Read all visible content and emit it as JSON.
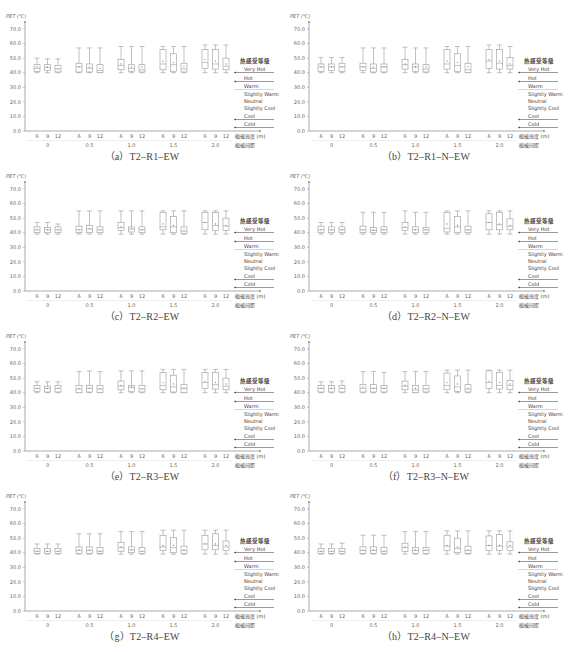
{
  "chart_data": {
    "type": "box",
    "figure_caption": "",
    "shared": {
      "ylabel": "PET (℃)",
      "yticks": [
        "0.0",
        "10.0",
        "20.0",
        "30.0",
        "40.0",
        "50.0",
        "60.0",
        "70.0"
      ],
      "ylim": [
        0,
        75
      ],
      "x_inner_label": "植被高度 (m)",
      "x_outer_label": "植被间距",
      "x_inner_ticks": [
        "6",
        "9",
        "12"
      ],
      "x_outer_groups": [
        "0",
        "0.5",
        "1.0",
        "1.5",
        "2.0"
      ],
      "legend_title": "热感受等级",
      "legend_levels": [
        "Very Hot",
        "Hot",
        "Warm",
        "Slightly Warm",
        "Neutral",
        "Slightly Cool",
        "Cool",
        "Cold"
      ],
      "legend_thresholds": [
        41,
        35,
        29,
        23,
        18,
        13,
        8,
        4
      ]
    },
    "panels": [
      {
        "caption": "（a）T2–R1–EW",
        "boxes": [
          [
            40,
            41,
            43,
            45.5,
            50,
            44
          ],
          [
            40,
            41.5,
            43.5,
            45.5,
            49.5,
            44
          ],
          [
            40,
            40.5,
            42.5,
            45,
            49.5,
            43
          ],
          [
            40,
            40.5,
            44,
            46.5,
            57,
            44
          ],
          [
            40,
            40.5,
            43,
            46,
            57,
            44
          ],
          [
            40,
            40,
            41.5,
            45.5,
            57,
            43
          ],
          [
            40,
            42,
            45,
            49,
            58,
            46
          ],
          [
            40,
            41,
            43,
            45.5,
            58,
            44
          ],
          [
            40,
            40.5,
            42,
            45.5,
            58,
            44
          ],
          [
            40,
            42,
            46,
            56,
            58,
            48
          ],
          [
            40,
            41,
            45.5,
            53,
            58,
            47
          ],
          [
            40,
            40.5,
            42.5,
            46.5,
            58,
            44
          ],
          [
            40,
            43,
            47,
            56,
            59,
            49
          ],
          [
            40,
            42.5,
            46,
            56,
            59,
            48
          ],
          [
            40,
            42,
            44.5,
            50,
            59,
            46
          ]
        ]
      },
      {
        "caption": "（b）T2–R1–N–EW",
        "boxes": [
          [
            40,
            41,
            44,
            46,
            50.5,
            44
          ],
          [
            40,
            41.5,
            44,
            46,
            50.5,
            44
          ],
          [
            40,
            41,
            44,
            46.5,
            50.5,
            44
          ],
          [
            40,
            41.5,
            44,
            46.5,
            57,
            44
          ],
          [
            40,
            40.5,
            43,
            46,
            57,
            44
          ],
          [
            40,
            40.5,
            44,
            46,
            57,
            44
          ],
          [
            40,
            42.5,
            45.5,
            49,
            57.5,
            46
          ],
          [
            40,
            41,
            44,
            46,
            57,
            44
          ],
          [
            40,
            40.5,
            42.5,
            45.5,
            57,
            44
          ],
          [
            40,
            42.5,
            46,
            56,
            58,
            48
          ],
          [
            40,
            41,
            45,
            53,
            58,
            47
          ],
          [
            40,
            40,
            42,
            46.5,
            58,
            44
          ],
          [
            40,
            43,
            48,
            56,
            59,
            49
          ],
          [
            40,
            42.5,
            46.5,
            56,
            59,
            48
          ],
          [
            40,
            42.5,
            45,
            50.5,
            58,
            46
          ]
        ]
      },
      {
        "caption": "（c）T2–R2–EW",
        "boxes": [
          [
            39,
            40,
            42,
            44,
            47,
            42
          ],
          [
            39,
            40,
            42,
            43.5,
            47,
            42
          ],
          [
            39,
            40,
            42,
            44,
            46,
            42
          ],
          [
            39,
            40,
            42,
            44.5,
            55,
            42
          ],
          [
            39,
            40,
            42.5,
            45,
            55,
            43
          ],
          [
            39,
            40,
            42,
            44,
            55,
            42
          ],
          [
            39,
            41.5,
            43.5,
            47,
            55,
            44
          ],
          [
            39,
            40.5,
            42.5,
            44,
            55,
            43
          ],
          [
            39,
            40,
            42,
            44,
            55,
            42
          ],
          [
            39,
            42,
            44,
            54,
            55,
            46
          ],
          [
            39,
            40,
            44,
            51,
            55,
            45
          ],
          [
            39,
            39.5,
            41,
            44,
            55,
            42
          ],
          [
            39,
            42,
            47,
            54,
            55,
            47
          ],
          [
            39,
            41.5,
            45,
            54,
            55,
            46
          ],
          [
            39,
            41.5,
            44.5,
            50,
            55,
            45
          ]
        ]
      },
      {
        "caption": "（d）T2–R2–N–EW",
        "boxes": [
          [
            39,
            40,
            42,
            44.5,
            47,
            42
          ],
          [
            39,
            40,
            42,
            44,
            47,
            42
          ],
          [
            39,
            40,
            42,
            44,
            47,
            42
          ],
          [
            39,
            40,
            42,
            44.5,
            54,
            42
          ],
          [
            39,
            40,
            41.5,
            43.5,
            54,
            42
          ],
          [
            39,
            40,
            42,
            44,
            54,
            42
          ],
          [
            39,
            41.5,
            43.5,
            47,
            55,
            44
          ],
          [
            39,
            40,
            42,
            44,
            54,
            42
          ],
          [
            39,
            40,
            42,
            43.5,
            54,
            42
          ],
          [
            39,
            40.5,
            43,
            54,
            55,
            46
          ],
          [
            39,
            40,
            44,
            51,
            55,
            45
          ],
          [
            39,
            40,
            42,
            44.5,
            55,
            42
          ],
          [
            39,
            42,
            47,
            53,
            55,
            47
          ],
          [
            39,
            42,
            45.5,
            54,
            55,
            46
          ],
          [
            39,
            42,
            44.5,
            49.5,
            55,
            45
          ]
        ]
      },
      {
        "caption": "（e）T2–R3–EW",
        "boxes": [
          [
            40,
            41,
            43,
            45,
            47.5,
            43
          ],
          [
            40,
            40.5,
            43,
            44.5,
            47.5,
            43
          ],
          [
            40,
            40.5,
            43,
            45,
            47.5,
            43
          ],
          [
            40,
            40,
            42.5,
            45,
            54.5,
            43
          ],
          [
            40,
            40.5,
            43,
            45,
            55,
            43
          ],
          [
            40,
            40,
            42.5,
            45,
            54.5,
            43
          ],
          [
            40,
            42,
            44.5,
            48,
            55,
            45
          ],
          [
            40,
            41,
            43.5,
            45,
            55,
            44
          ],
          [
            40,
            40.5,
            42.5,
            45,
            55,
            43
          ],
          [
            40,
            42,
            45,
            54,
            56,
            47
          ],
          [
            40,
            40.5,
            44,
            52,
            56,
            46
          ],
          [
            40,
            40,
            43,
            45.5,
            56,
            43
          ],
          [
            40,
            43,
            47,
            54,
            56,
            48
          ],
          [
            40,
            42.5,
            45.5,
            54,
            56,
            47
          ],
          [
            40,
            42,
            44.5,
            50,
            56,
            46
          ]
        ]
      },
      {
        "caption": "（f）T2–R3–N–EW",
        "boxes": [
          [
            40,
            40.5,
            43,
            45,
            47.5,
            43
          ],
          [
            40,
            40.5,
            43,
            45,
            47.5,
            43
          ],
          [
            40,
            40.5,
            43,
            45,
            48,
            43
          ],
          [
            40,
            40.5,
            43,
            45.5,
            54.5,
            44
          ],
          [
            40,
            40.5,
            43,
            45.5,
            54.5,
            43
          ],
          [
            40,
            40.5,
            43,
            45,
            54,
            43
          ],
          [
            40,
            42,
            44.5,
            48,
            54.5,
            45
          ],
          [
            40,
            40,
            42,
            45,
            54.5,
            43
          ],
          [
            40,
            40.5,
            42.5,
            45,
            54.5,
            43
          ],
          [
            40,
            42,
            45,
            53.5,
            55.5,
            47
          ],
          [
            40,
            41,
            44,
            51.5,
            55.5,
            46
          ],
          [
            40,
            40.5,
            42.5,
            45.5,
            55.5,
            43
          ],
          [
            40,
            43,
            47,
            55,
            55.5,
            48
          ],
          [
            40,
            42.5,
            45,
            54,
            55.5,
            47
          ],
          [
            40,
            42,
            45,
            48.5,
            55.5,
            46
          ]
        ]
      },
      {
        "caption": "（g）T2–R4–EW",
        "boxes": [
          [
            39,
            39.5,
            41,
            43,
            46,
            41
          ],
          [
            39,
            39.5,
            41,
            43,
            46,
            41
          ],
          [
            39,
            39.5,
            41,
            43,
            46,
            41
          ],
          [
            39,
            39.5,
            41.5,
            44,
            53,
            42
          ],
          [
            39,
            39.5,
            41.5,
            44,
            53,
            42
          ],
          [
            39,
            39.5,
            41,
            43.5,
            53,
            41
          ],
          [
            39,
            41,
            43.5,
            47,
            54.5,
            44
          ],
          [
            39,
            40,
            42,
            44,
            54.5,
            42
          ],
          [
            39,
            39.5,
            41,
            43.5,
            54.5,
            41
          ],
          [
            39,
            41.5,
            44,
            52,
            55.5,
            45
          ],
          [
            39,
            40,
            43.5,
            50.5,
            55.5,
            45
          ],
          [
            39,
            39.5,
            41.5,
            44.5,
            55.5,
            42
          ],
          [
            39,
            42,
            46,
            52,
            55.5,
            46
          ],
          [
            39,
            42,
            45,
            53,
            55.5,
            46
          ],
          [
            39,
            41.5,
            44,
            48,
            55.5,
            45
          ]
        ]
      },
      {
        "caption": "（h）T2–R4–N–EW",
        "boxes": [
          [
            39,
            39.5,
            41,
            43,
            46,
            41
          ],
          [
            39,
            39.5,
            41,
            43,
            46,
            41
          ],
          [
            39,
            39.5,
            41,
            43,
            46.5,
            41
          ],
          [
            39,
            39.5,
            41.5,
            44,
            52,
            42
          ],
          [
            39,
            39.5,
            41.5,
            44,
            52,
            42
          ],
          [
            39,
            39.5,
            41,
            43.5,
            52,
            41
          ],
          [
            39,
            41,
            43.5,
            46.5,
            54.5,
            44
          ],
          [
            39,
            39.5,
            41.5,
            43.5,
            54.5,
            42
          ],
          [
            39,
            39.5,
            41.5,
            43.5,
            54.5,
            42
          ],
          [
            39,
            41.5,
            44.5,
            52,
            55,
            45
          ],
          [
            39,
            40,
            43,
            50,
            55,
            44
          ],
          [
            39,
            39.5,
            41.5,
            44.5,
            55,
            42
          ],
          [
            39,
            41.5,
            45,
            51.5,
            55,
            45
          ],
          [
            39,
            41.5,
            44.5,
            52.5,
            55,
            45
          ],
          [
            39,
            41.5,
            44,
            47.5,
            55,
            45
          ]
        ]
      }
    ],
    "box_format": [
      "whisker_low",
      "q1",
      "median",
      "q3",
      "whisker_high",
      "mean"
    ]
  },
  "layout": {
    "panel_positions": [
      [
        0,
        0
      ],
      [
        284,
        0
      ],
      [
        0,
        160
      ],
      [
        284,
        160
      ],
      [
        0,
        320
      ],
      [
        284,
        320
      ],
      [
        0,
        480
      ],
      [
        284,
        480
      ]
    ],
    "caption_offsets": [
      148,
      148,
      148,
      148,
      148,
      148,
      148,
      148
    ],
    "colors": {
      "axis": "#888888",
      "box": "#999999",
      "legend_line": "#555555",
      "grid_line": "#cccccc",
      "text": "#555555"
    }
  }
}
